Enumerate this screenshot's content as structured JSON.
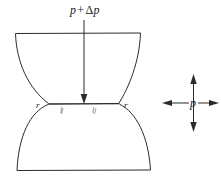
{
  "figure": {
    "background_color": "#ffffff",
    "line_color": "#2b2b2b",
    "labels": {
      "applied_pressure": {
        "base": "p",
        "operator": "+",
        "delta": "Δ",
        "delta_var": "p",
        "full": "p + Δp"
      },
      "ambient_pressure": "p",
      "neck_radius_left": "r",
      "neck_radius_right": "r",
      "length_left": "l",
      "length_right": "l"
    },
    "arrows": {
      "vertical_down": {
        "name": "pressure-arrow-down",
        "direction": "down"
      },
      "cross_up": {
        "name": "cross-arrow-up",
        "direction": "up"
      },
      "cross_down": {
        "name": "cross-arrow-down",
        "direction": "down"
      },
      "cross_left": {
        "name": "cross-arrow-left",
        "direction": "left"
      },
      "cross_right": {
        "name": "cross-arrow-right",
        "direction": "right"
      }
    },
    "shapes": {
      "upper_particle": "bowl-shaped upper grain with flat top edge",
      "lower_particle": "dome-shaped lower grain with flat bottom edge",
      "neck": "horizontal contact line between grains"
    }
  }
}
